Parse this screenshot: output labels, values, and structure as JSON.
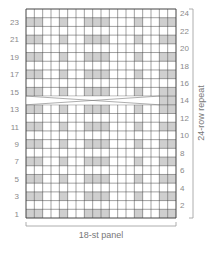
{
  "chart_data": {
    "type": "knitting-chart",
    "title": "",
    "columns": 18,
    "rows": 24,
    "x_label": "18-st panel",
    "y_label": "24-row repeat",
    "left_row_labels": [
      "1",
      "3",
      "5",
      "7",
      "9",
      "11",
      "13",
      "15",
      "17",
      "19",
      "21",
      "23"
    ],
    "right_row_labels": [
      "2",
      "4",
      "6",
      "8",
      "10",
      "12",
      "14",
      "16",
      "18",
      "20",
      "22",
      "24"
    ],
    "shaded_columns_odd_rows": [
      1,
      2,
      5,
      8,
      9,
      10,
      14,
      17,
      18
    ],
    "shaded_rows": [
      1,
      3,
      5,
      7,
      9,
      11,
      13,
      15,
      17,
      19,
      21,
      23
    ],
    "cable_cross_row": 14,
    "cable_cross_span": [
      1,
      16
    ],
    "cable_row_shaded_columns": [
      17,
      18
    ],
    "colors": {
      "shade": "#cfcfcf",
      "grid": "#444444",
      "background": "#ffffff",
      "text": "#8a8a8a"
    }
  }
}
